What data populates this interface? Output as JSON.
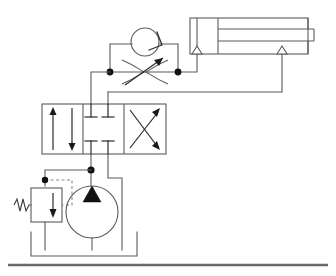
{
  "diagram": {
    "title": "Hydraulic Circuit Diagram",
    "type": "hydraulic-schematic",
    "background_color": "#ffffff",
    "line_color": "#5b5b5b",
    "accent_color": "#111111",
    "pilot_line_color": "#8a8a8a"
  },
  "components": [
    {
      "id": "cylinder",
      "data_name": "double-acting-cylinder",
      "label": "",
      "kind": "double-acting-cylinder",
      "bounds": {
        "x": 190,
        "y": 18,
        "width": 118,
        "height": 36
      },
      "ports": [
        "cap-end",
        "rod-end"
      ]
    },
    {
      "id": "check-valve",
      "data_name": "check-valve",
      "label": "",
      "kind": "check-valve",
      "bounds": {
        "x": 131,
        "y": 28,
        "width": 30,
        "height": 26
      }
    },
    {
      "id": "flow-control",
      "data_name": "adjustable-flow-control-valve",
      "label": "",
      "kind": "variable-throttle",
      "bounds": {
        "x": 118,
        "y": 58,
        "width": 64,
        "height": 28
      }
    },
    {
      "id": "directional-valve",
      "data_name": "directional-control-valve-4-3",
      "label": "",
      "kind": "4-3-way-valve",
      "positions": [
        "parallel-arrows",
        "closed-center",
        "crossed-arrows"
      ],
      "bounds": {
        "x": 42,
        "y": 104,
        "width": 124,
        "height": 50
      }
    },
    {
      "id": "relief-valve",
      "data_name": "pressure-relief-valve",
      "label": "",
      "kind": "spring-loaded-relief-valve",
      "bounds": {
        "x": 28,
        "y": 186,
        "width": 30,
        "height": 34
      }
    },
    {
      "id": "pump",
      "data_name": "fixed-displacement-pump",
      "label": "",
      "kind": "hydraulic-pump",
      "center": {
        "x": 92,
        "y": 212
      },
      "radius": 26
    },
    {
      "id": "reservoir",
      "data_name": "reservoir-tank",
      "label": "",
      "kind": "open-tank",
      "bounds": {
        "x": 31,
        "y": 232,
        "width": 106,
        "height": 24
      }
    },
    {
      "id": "ground-line",
      "data_name": "ground-base-line",
      "label": "",
      "kind": "base-line",
      "bounds": {
        "x": 8,
        "y": 264,
        "width": 320,
        "height": 2
      }
    }
  ],
  "junctions": [
    {
      "data_name": "junction-node-a",
      "x": 110,
      "y": 72
    },
    {
      "data_name": "junction-node-b",
      "x": 178,
      "y": 72
    },
    {
      "data_name": "junction-node-pressure",
      "x": 92,
      "y": 170
    },
    {
      "data_name": "junction-node-pilot",
      "x": 45,
      "y": 180
    }
  ]
}
